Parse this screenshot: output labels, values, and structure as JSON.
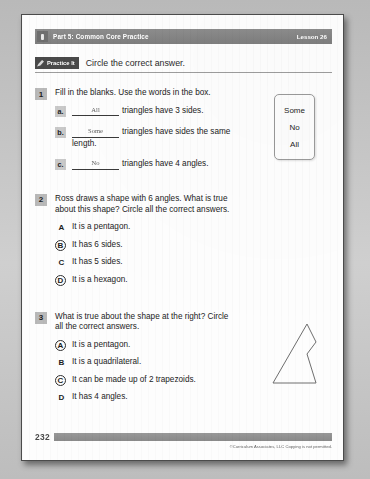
{
  "header": {
    "icon": "pencil-badge-icon",
    "part_title": "Part 5: Common Core Practice",
    "lesson_label": "Lesson 26"
  },
  "practice": {
    "badge_icon": "pencil-icon",
    "badge_label": "Practice It",
    "instruction": "Circle the correct answer."
  },
  "questions": [
    {
      "number": "1",
      "stem": "Fill in the blanks. Use the words in the box.",
      "parts": [
        {
          "letter": "a.",
          "answer": "All",
          "text": "triangles have 3 sides."
        },
        {
          "letter": "b.",
          "answer": "Some",
          "text": "triangles have sides the same length."
        },
        {
          "letter": "c.",
          "answer": "No",
          "text": "triangles have 4 angles."
        }
      ],
      "word_box": [
        "Some",
        "No",
        "All"
      ]
    },
    {
      "number": "2",
      "stem": "Ross draws a shape with 6 angles. What is true about this shape? Circle all the correct answers.",
      "choices": [
        {
          "letter": "A",
          "text": "It is a pentagon.",
          "circled": false
        },
        {
          "letter": "B",
          "text": "It has 6 sides.",
          "circled": true
        },
        {
          "letter": "C",
          "text": "It has 5 sides.",
          "circled": false
        },
        {
          "letter": "D",
          "text": "It is a hexagon.",
          "circled": true
        }
      ]
    },
    {
      "number": "3",
      "stem": "What is true about the shape at the right? Circle all the correct answers.",
      "choices": [
        {
          "letter": "A",
          "text": "It is a pentagon.",
          "circled": true
        },
        {
          "letter": "B",
          "text": "It is a quadrilateral.",
          "circled": false
        },
        {
          "letter": "C",
          "text": "It can be made up of 2 trapezoids.",
          "circled": true
        },
        {
          "letter": "D",
          "text": "It has 4 angles.",
          "circled": false
        }
      ],
      "figure": {
        "name": "concave-pentagon-shape",
        "stroke": "#6e6e6e"
      }
    }
  ],
  "footer": {
    "page_number": "232",
    "copyright": "©Curriculum Associates, LLC   Copying is not permitted."
  },
  "colors": {
    "part_bar": "#858585",
    "badge": "#4a4a4a",
    "number_chip": "#b9b9b9",
    "rule": "#9d9d9d",
    "page": "#fdfdfd"
  }
}
